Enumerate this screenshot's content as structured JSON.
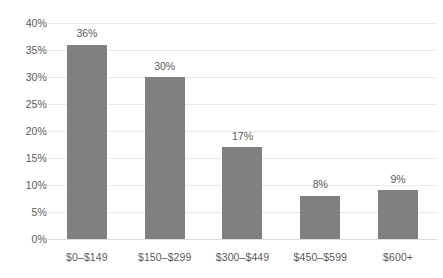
{
  "chart_data": {
    "type": "bar",
    "title": "",
    "subtitle": "",
    "xlabel": "",
    "ylabel": "",
    "categories": [
      "$0–$149",
      "$150–$299",
      "$300–$449",
      "$450–$599",
      "$600+"
    ],
    "values": [
      36,
      30,
      17,
      8,
      9
    ],
    "data_labels": [
      "36%",
      "30%",
      "17%",
      "8%",
      "9%"
    ],
    "ylim": [
      0,
      40
    ],
    "ytick_values": [
      0,
      5,
      10,
      15,
      20,
      25,
      30,
      35,
      40
    ],
    "ytick_labels": [
      "0%",
      "5%",
      "10%",
      "15%",
      "20%",
      "25%",
      "30%",
      "35%",
      "40%"
    ],
    "grid": true,
    "grid_axis": "y",
    "legend": false,
    "legend_position": "none",
    "series": [
      {
        "name": "Share of respondents",
        "values": [
          36,
          30,
          17,
          8,
          9
        ]
      }
    ],
    "colors": {
      "bar_fill": "#808080",
      "gridline": "#e8e8e8",
      "baseline": "#dcdcdc",
      "tick_text": "#5a5a5a",
      "background": "#ffffff"
    }
  }
}
